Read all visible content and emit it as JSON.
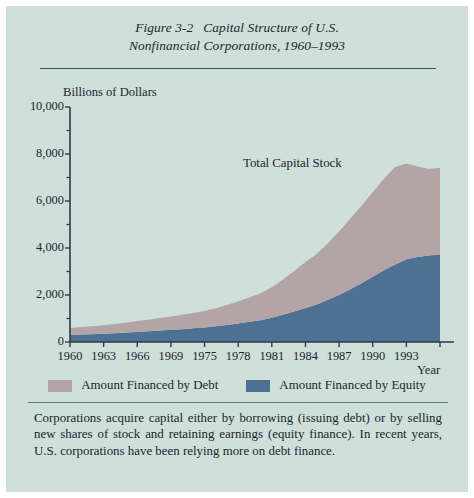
{
  "figure": {
    "number": "Figure 3-2",
    "title_line1": "Capital Structure of U.S.",
    "title_line2": "Nonfinancial Corporations, 1960–1993"
  },
  "colors": {
    "background": "#cfdfd9",
    "debt": "#b3a5a5",
    "equity": "#4d7193",
    "axis": "#2a3d4a",
    "rule": "#35566e",
    "text": "#1b2630"
  },
  "legend": {
    "items": [
      {
        "label": "Amount Financed by Debt",
        "color": "#b3a5a5",
        "key": "debt"
      },
      {
        "label": "Amount Financed by Equity",
        "color": "#4d7193",
        "key": "equity"
      }
    ]
  },
  "caption": "Corporations acquire capital either by borrowing (issuing debt) or by selling new shares of stock and retaining earnings (equity finance). In recent years, U.S. corporations have been relying more on debt finance.",
  "chart_data": {
    "type": "area",
    "stacked": true,
    "title": "Capital Structure of U.S. Nonfinancial Corporations, 1960–1993",
    "xlabel": "Year",
    "ylabel": "Billions of Dollars",
    "ylim": [
      0,
      10000
    ],
    "ytick_labels": [
      "0",
      "2,000",
      "4,000",
      "6,000",
      "8,000",
      "10,000"
    ],
    "ytick_values": [
      0,
      2000,
      4000,
      6000,
      8000,
      10000
    ],
    "yminor_values": [
      1000,
      3000,
      5000,
      7000,
      9000
    ],
    "xlim": [
      1960,
      1993
    ],
    "xtick_labels": [
      "1960",
      "1963",
      "1966",
      "1969",
      "1975",
      "1978",
      "1981",
      "1984",
      "1987",
      "1990",
      "1993"
    ],
    "xtick_values": [
      1960,
      1963,
      1966,
      1969,
      1972,
      1975,
      1978,
      1981,
      1984,
      1987,
      1990
    ],
    "grid": false,
    "legend_position": "below",
    "annotations": [
      {
        "text": "Total Capital Stock",
        "x": 1983,
        "y": 8000
      }
    ],
    "x": [
      1960,
      1961,
      1962,
      1963,
      1964,
      1965,
      1966,
      1967,
      1968,
      1969,
      1970,
      1971,
      1972,
      1973,
      1974,
      1975,
      1976,
      1977,
      1978,
      1979,
      1980,
      1981,
      1982,
      1983,
      1984,
      1985,
      1986,
      1987,
      1988,
      1989,
      1990,
      1991,
      1992,
      1993
    ],
    "series": [
      {
        "name": "Amount Financed by Equity",
        "color": "#4d7193",
        "values": [
          300,
          315,
          330,
          350,
          375,
          400,
          430,
          455,
          490,
          520,
          545,
          580,
          620,
          670,
          720,
          790,
          860,
          930,
          1030,
          1160,
          1300,
          1450,
          1600,
          1800,
          2000,
          2250,
          2500,
          2780,
          3050,
          3300,
          3520,
          3620,
          3680,
          3720
        ]
      },
      {
        "name": "Amount Financed by Debt",
        "color": "#b3a5a5",
        "values": [
          300,
          320,
          340,
          360,
          390,
          420,
          460,
          490,
          530,
          570,
          610,
          650,
          700,
          770,
          850,
          940,
          1030,
          1140,
          1300,
          1500,
          1720,
          1950,
          2150,
          2400,
          2700,
          3000,
          3300,
          3600,
          3900,
          4150,
          4080,
          3850,
          3680,
          3700
        ]
      }
    ],
    "totals": [
      600,
      635,
      670,
      710,
      765,
      820,
      890,
      945,
      1020,
      1090,
      1155,
      1230,
      1320,
      1440,
      1570,
      1730,
      1890,
      2070,
      2330,
      2660,
      3020,
      3400,
      3750,
      4200,
      4700,
      5250,
      5800,
      6380,
      6950,
      7450,
      7600,
      7470,
      7360,
      7420
    ]
  }
}
